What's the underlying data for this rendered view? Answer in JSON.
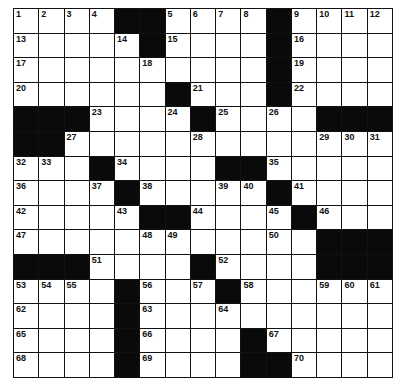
{
  "puzzle": {
    "rows": 15,
    "cols": 15,
    "grid": [
      [
        "1",
        "2",
        "3",
        "4",
        "#",
        "#",
        "5",
        "6",
        "7",
        "8",
        "#",
        "9",
        "10",
        "11",
        "12"
      ],
      [
        "13",
        ".",
        ".",
        ".",
        "14",
        "#",
        "15",
        ".",
        ".",
        ".",
        "#",
        "16",
        ".",
        ".",
        "."
      ],
      [
        "17",
        ".",
        ".",
        ".",
        ".",
        "18",
        ".",
        ".",
        ".",
        ".",
        "#",
        "19",
        ".",
        ".",
        "."
      ],
      [
        "20",
        ".",
        ".",
        ".",
        ".",
        ".",
        "#",
        "21",
        ".",
        ".",
        "#",
        "22",
        ".",
        ".",
        "."
      ],
      [
        "#",
        "#",
        "#",
        "23",
        ".",
        ".",
        "24",
        "#",
        "25",
        ".",
        "26",
        ".",
        "#",
        "#",
        "#"
      ],
      [
        "#",
        "#",
        "27",
        ".",
        ".",
        ".",
        ".",
        "28",
        ".",
        ".",
        ".",
        ".",
        "29",
        "30",
        "31"
      ],
      [
        "32",
        "33",
        ".",
        "#",
        "34",
        ".",
        ".",
        ".",
        "#",
        "#",
        "35",
        ".",
        ".",
        ".",
        "."
      ],
      [
        "36",
        ".",
        ".",
        "37",
        "#",
        "38",
        ".",
        ".",
        "39",
        "40",
        "#",
        "41",
        ".",
        ".",
        "."
      ],
      [
        "42",
        ".",
        ".",
        ".",
        "43",
        "#",
        "#",
        "44",
        ".",
        ".",
        "45",
        "#",
        "46",
        ".",
        "."
      ],
      [
        "47",
        ".",
        ".",
        ".",
        ".",
        "48",
        "49",
        ".",
        ".",
        ".",
        "50",
        ".",
        "#",
        "#",
        "#"
      ],
      [
        "#",
        "#",
        "#",
        "51",
        ".",
        ".",
        ".",
        "#",
        "52",
        ".",
        ".",
        ".",
        "#",
        "#",
        "#"
      ],
      [
        "53",
        "54",
        "55",
        ".",
        "#",
        "56",
        ".",
        "57",
        "#",
        "58",
        ".",
        ".",
        "59",
        "60",
        "61"
      ],
      [
        "62",
        ".",
        ".",
        ".",
        "#",
        "63",
        ".",
        ".",
        "64",
        ".",
        ".",
        ".",
        ".",
        ".",
        "."
      ],
      [
        "65",
        ".",
        ".",
        ".",
        "#",
        "66",
        ".",
        ".",
        ".",
        "#",
        "67",
        ".",
        ".",
        ".",
        "."
      ],
      [
        "68",
        ".",
        ".",
        ".",
        "#",
        "69",
        ".",
        ".",
        ".",
        "#",
        "#",
        "70",
        ".",
        ".",
        "."
      ]
    ]
  },
  "colors": {
    "block": "#0a0a0a",
    "cell": "#ffffff",
    "line": "#111111"
  }
}
